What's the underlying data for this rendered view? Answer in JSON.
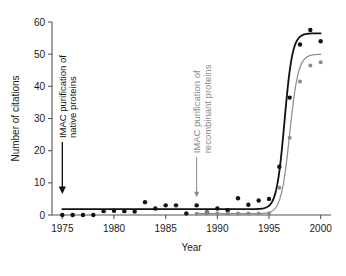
{
  "chart_data": {
    "type": "scatter",
    "title": "",
    "xlabel": "Year",
    "ylabel": "Number of citations",
    "xlim": [
      1974,
      2001
    ],
    "ylim": [
      0,
      60
    ],
    "grid": false,
    "legend": null,
    "xticks": [
      1975,
      1980,
      1985,
      1990,
      1995,
      2000
    ],
    "xtick_labels": [
      "1975",
      "1980",
      "1985",
      "1990",
      "1995",
      "2000"
    ],
    "yticks": [
      0,
      10,
      20,
      30,
      40,
      50,
      60
    ],
    "ytick_labels": [
      "0",
      "10",
      "20",
      "30",
      "40",
      "50",
      "60"
    ],
    "series": [
      {
        "name": "IMAC purification of native proteins",
        "color": "#111111",
        "marker": "filled-circle",
        "x": [
          1975,
          1976,
          1977,
          1978,
          1979,
          1980,
          1981,
          1982,
          1983,
          1984,
          1985,
          1986,
          1987,
          1988,
          1989,
          1990,
          1991,
          1992,
          1993,
          1994,
          1995,
          1996,
          1997,
          1998,
          1999,
          2000
        ],
        "values": [
          0,
          0,
          0,
          0,
          1.2,
          1.3,
          1.2,
          1.1,
          4.0,
          2.0,
          3.0,
          3.0,
          0.5,
          3.0,
          0.8,
          2.0,
          1.5,
          5.2,
          3.2,
          4.5,
          5.0,
          15.0,
          36.5,
          53.0,
          57.5,
          54.0
        ],
        "fit_curve": {
          "type": "sigmoid",
          "baseline": 1.8,
          "plateau": 56.5,
          "midpoint_year": 1996.5,
          "steepness": 2.6
        }
      },
      {
        "name": "IMAC purification of recombinant proteins",
        "color": "#8a8a8a",
        "marker": "filled-circle",
        "x": [
          1988,
          1989,
          1990,
          1991,
          1992,
          1993,
          1994,
          1995,
          1996,
          1997,
          1998,
          1999,
          2000
        ],
        "values": [
          0.4,
          0.6,
          0.5,
          0.5,
          0.5,
          0.5,
          0.5,
          0.5,
          8.5,
          24.0,
          41.5,
          46.5,
          47.5
        ],
        "fit_curve": {
          "type": "sigmoid",
          "baseline": 0.4,
          "plateau": 50.0,
          "midpoint_year": 1997.0,
          "steepness": 2.4
        }
      }
    ],
    "annotations": [
      {
        "id": "annot-native",
        "label_line1": "IMAC purification of",
        "label_line2": "native proteins",
        "color": "#111111",
        "anchor_year": 1975,
        "anchor_value": 6.5,
        "arrow": "down-filled"
      },
      {
        "id": "annot-recombinant",
        "label_line1": "IMAC purification of",
        "label_line2": "recombinant proteins",
        "color": "#8a8a8a",
        "anchor_year": 1988,
        "anchor_value": 5.5,
        "arrow": "down-thin"
      }
    ],
    "colors": {
      "axis": "#555555",
      "native_series": "#111111",
      "recombinant_series": "#8a8a8a",
      "background": "#ffffff",
      "text": "#1a1a1a"
    }
  }
}
